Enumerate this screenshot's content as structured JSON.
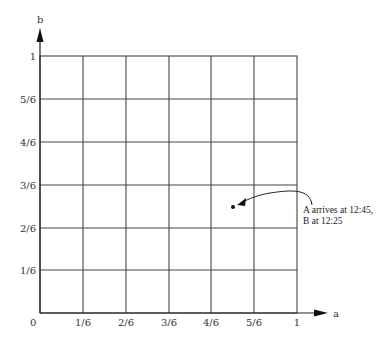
{
  "axes": {
    "x_label": "a",
    "y_label": "b",
    "origin_label": "0",
    "x_ticks": [
      "1/6",
      "2/6",
      "3/6",
      "4/6",
      "5/6",
      "1"
    ],
    "y_ticks": [
      "1/6",
      "2/6",
      "3/6",
      "4/6",
      "5/6",
      "1"
    ]
  },
  "point": {
    "a": 0.75,
    "b": 0.41,
    "annotation_line1": "A arrives at 12:45,",
    "annotation_line2": "B at 12:25"
  },
  "colors": {
    "line": "#333333",
    "grid": "#444444",
    "background": "#ffffff"
  }
}
